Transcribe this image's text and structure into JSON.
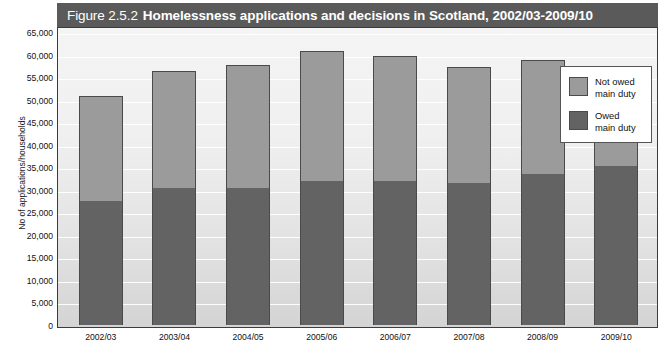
{
  "figure": {
    "title_prefix": "Figure 2.5.2",
    "title_main": "Homelessness applications and decisions in Scotland, 2002/03-2009/10",
    "title_bar_color": "#5a5a5a"
  },
  "legend": {
    "items": [
      {
        "label_line1": "Not owed",
        "label_line2": "main duty",
        "color": "#9b9b9b",
        "swatch_name": "legend-swatch-not-owed"
      },
      {
        "label_line1": "Owed",
        "label_line2": "main duty",
        "color": "#636363",
        "swatch_name": "legend-swatch-owed"
      }
    ]
  },
  "chart_data": {
    "type": "bar",
    "stacked": true,
    "title": "Figure 2.5.2 Homelessness applications and decisions in Scotland, 2002/03-2009/10",
    "xlabel": "",
    "ylabel": "No of applications/households",
    "ylim": [
      0,
      65000
    ],
    "ytick_step": 5000,
    "grid": true,
    "legend_position": "right-inside-top",
    "categories": [
      "2002/03",
      "2003/04",
      "2004/05",
      "2005/06",
      "2006/07",
      "2007/08",
      "2008/09",
      "2009/10"
    ],
    "ytick_labels": [
      "65,000",
      "60,000",
      "55,000",
      "50,000",
      "45,000",
      "40,000",
      "35,000",
      "30,000",
      "25,000",
      "20,000",
      "15,000",
      "10,000",
      "5,000",
      "0"
    ],
    "ytick_values": [
      65000,
      60000,
      55000,
      50000,
      45000,
      40000,
      35000,
      30000,
      25000,
      20000,
      15000,
      10000,
      5000,
      0
    ],
    "series": [
      {
        "name": "Owed main duty",
        "color": "#636363",
        "values": [
          27500,
          30500,
          30500,
          32000,
          32000,
          31500,
          33500,
          35200
        ]
      },
      {
        "name": "Not owed main duty",
        "color": "#9b9b9b",
        "values": [
          23200,
          25800,
          27200,
          28800,
          27700,
          25700,
          25200,
          21900
        ]
      }
    ],
    "totals": [
      50700,
      56300,
      57700,
      60800,
      59700,
      57200,
      58700,
      57100
    ]
  }
}
